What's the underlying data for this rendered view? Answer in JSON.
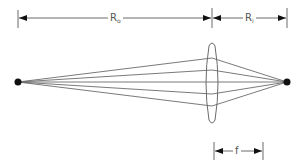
{
  "diagram": {
    "colors": {
      "line": "#6b6b6b",
      "point": "#111111",
      "text": "#555555",
      "background": "#ffffff"
    },
    "labels": {
      "object_distance": {
        "main": "R",
        "sub": "o"
      },
      "image_distance": {
        "main": "R",
        "sub": "i"
      },
      "focal_length": "f"
    },
    "object_point": {
      "x": 18,
      "y": 82
    },
    "image_point": {
      "x": 287,
      "y": 82
    },
    "lens": {
      "cx": 212,
      "top": 44,
      "bottom": 122,
      "half_width": 6
    },
    "rays_at_lens_y": [
      58,
      70,
      82,
      94,
      106
    ],
    "dimension_lines": {
      "top_y": 18,
      "focal_y": 151,
      "focal_x1": 214,
      "focal_x2": 263
    }
  }
}
